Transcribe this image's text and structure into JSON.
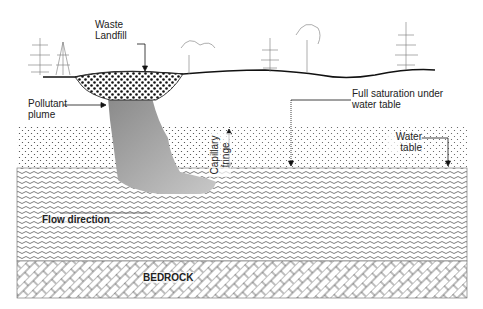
{
  "labels": {
    "landfill_line1": "Waste",
    "landfill_line2": "Landfill",
    "plume_line1": "Pollutant",
    "plume_line2": "plume",
    "saturation_line1": "Full saturation under",
    "saturation_line2": "water table",
    "water_table_line1": "Water",
    "water_table_line2": "table",
    "capillary_line1": "Capillary",
    "capillary_line2": "fringe",
    "flow": "Flow direction",
    "bedrock": "BEDROCK"
  },
  "layers": [
    {
      "name": "surface",
      "pattern": "ground line with trees"
    },
    {
      "name": "unsaturated-zone",
      "pattern": "dots"
    },
    {
      "name": "saturated-zone",
      "pattern": "waves"
    },
    {
      "name": "bedrock",
      "pattern": "brick hatch"
    }
  ],
  "colors": {
    "line": "#111111",
    "plume_light": "#c8c8c8",
    "plume_dark": "#8a8a8a",
    "pattern": "#555555"
  }
}
